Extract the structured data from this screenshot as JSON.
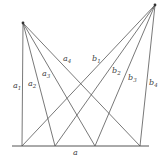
{
  "diagram": {
    "baseline_label": "a",
    "left_apex_rays": [
      {
        "name": "a",
        "sub": "1"
      },
      {
        "name": "a",
        "sub": "2"
      },
      {
        "name": "a",
        "sub": "3"
      },
      {
        "name": "a",
        "sub": "4"
      }
    ],
    "right_apex_rays": [
      {
        "name": "b",
        "sub": "1"
      },
      {
        "name": "b",
        "sub": "2"
      },
      {
        "name": "b",
        "sub": "3"
      },
      {
        "name": "b",
        "sub": "4"
      }
    ],
    "colors": {
      "line": "#555555",
      "text": "#444444",
      "background": "#ffffff"
    }
  }
}
